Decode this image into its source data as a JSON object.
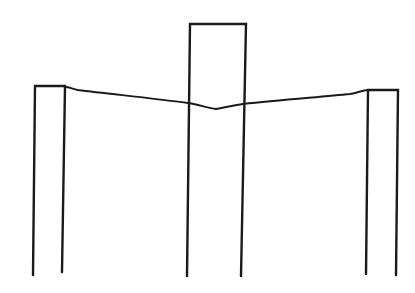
{
  "diagram": {
    "width": 415,
    "height": 293,
    "background": "#ffffff",
    "stroke": "#1a1a1a",
    "stroke_width": 2.4,
    "elements": [
      {
        "name": "left-post-frame",
        "type": "open-rect",
        "points": "33,275 35,86 65,86 62,272"
      },
      {
        "name": "center-post-frame",
        "type": "open-rect",
        "points": "187,276 190,24 246,24 241,276"
      },
      {
        "name": "right-post-frame",
        "type": "open-rect",
        "points": "366,274 368,90 398,90 396,275"
      },
      {
        "name": "sagging-cable",
        "type": "curve",
        "d": "M 65,87 C 70,87 72,89 78,90 C 110,94 150,98 188,103 C 200,105 208,108 216,109 C 222,108 230,106 243,104 C 280,100 320,97 350,94 C 358,93 362,90 368,90"
      }
    ]
  }
}
